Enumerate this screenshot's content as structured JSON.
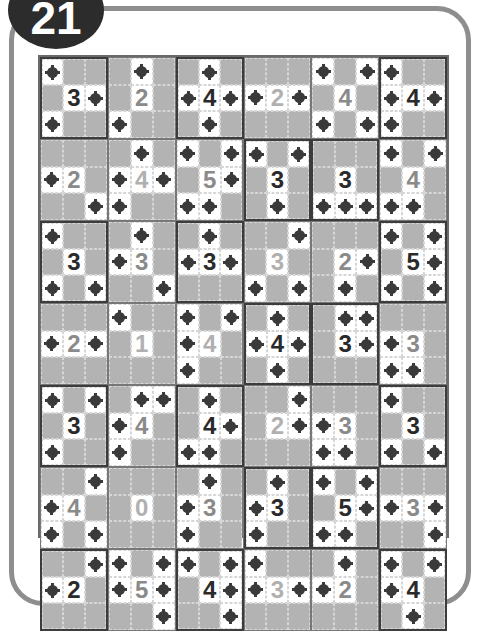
{
  "badge": {
    "label": "21"
  },
  "puzzle": {
    "columns": 6,
    "rows": 7,
    "colors": {
      "dark": "#2a2a2a",
      "gray": "#8a8a8a",
      "light": "#b0b0b0",
      "cell_shaded": "#b3b3b3",
      "cell_open": "#ffffff"
    },
    "blocks": [
      [
        {
          "n": "3",
          "tone": "dark",
          "mines": [
            [
              0,
              0
            ],
            [
              1,
              2
            ],
            [
              2,
              0
            ]
          ]
        },
        {
          "n": "2",
          "tone": "gray",
          "mines": [
            [
              0,
              1
            ],
            [
              2,
              0
            ]
          ]
        },
        {
          "n": "4",
          "tone": "dark",
          "mines": [
            [
              0,
              1
            ],
            [
              1,
              0
            ],
            [
              1,
              2
            ],
            [
              2,
              1
            ]
          ]
        },
        {
          "n": "2",
          "tone": "light",
          "mines": [
            [
              1,
              0
            ],
            [
              1,
              2
            ]
          ]
        },
        {
          "n": "4",
          "tone": "gray",
          "mines": [
            [
              0,
              0
            ],
            [
              0,
              2
            ],
            [
              2,
              0
            ],
            [
              2,
              2
            ]
          ]
        },
        {
          "n": "4",
          "tone": "dark",
          "mines": [
            [
              0,
              0
            ],
            [
              1,
              0
            ],
            [
              1,
              2
            ],
            [
              2,
              0
            ]
          ]
        }
      ],
      [
        {
          "n": "2",
          "tone": "gray",
          "mines": [
            [
              1,
              0
            ],
            [
              2,
              2
            ]
          ]
        },
        {
          "n": "4",
          "tone": "light",
          "mines": [
            [
              0,
              1
            ],
            [
              1,
              0
            ],
            [
              1,
              2
            ],
            [
              2,
              0
            ]
          ]
        },
        {
          "n": "5",
          "tone": "gray",
          "mines": [
            [
              0,
              0
            ],
            [
              0,
              2
            ],
            [
              1,
              2
            ],
            [
              2,
              0
            ],
            [
              2,
              1
            ]
          ]
        },
        {
          "n": "3",
          "tone": "dark",
          "mines": [
            [
              0,
              0
            ],
            [
              0,
              2
            ],
            [
              2,
              1
            ]
          ]
        },
        {
          "n": "3",
          "tone": "dark",
          "mines": [
            [
              2,
              0
            ],
            [
              2,
              1
            ],
            [
              2,
              2
            ]
          ]
        },
        {
          "n": "4",
          "tone": "gray",
          "mines": [
            [
              0,
              0
            ],
            [
              0,
              2
            ],
            [
              2,
              0
            ],
            [
              2,
              1
            ]
          ]
        }
      ],
      [
        {
          "n": "3",
          "tone": "dark",
          "mines": [
            [
              0,
              0
            ],
            [
              2,
              0
            ],
            [
              2,
              2
            ]
          ]
        },
        {
          "n": "3",
          "tone": "gray",
          "mines": [
            [
              0,
              1
            ],
            [
              1,
              0
            ],
            [
              2,
              2
            ]
          ]
        },
        {
          "n": "3",
          "tone": "dark",
          "mines": [
            [
              0,
              1
            ],
            [
              1,
              0
            ],
            [
              1,
              2
            ]
          ]
        },
        {
          "n": "3",
          "tone": "light",
          "mines": [
            [
              0,
              2
            ],
            [
              2,
              0
            ],
            [
              2,
              2
            ]
          ]
        },
        {
          "n": "2",
          "tone": "gray",
          "mines": [
            [
              1,
              2
            ],
            [
              2,
              1
            ]
          ]
        },
        {
          "n": "5",
          "tone": "dark",
          "mines": [
            [
              0,
              0
            ],
            [
              0,
              2
            ],
            [
              1,
              2
            ],
            [
              2,
              0
            ],
            [
              2,
              2
            ]
          ]
        }
      ],
      [
        {
          "n": "2",
          "tone": "gray",
          "mines": [
            [
              1,
              0
            ],
            [
              1,
              2
            ]
          ]
        },
        {
          "n": "1",
          "tone": "light",
          "mines": [
            [
              0,
              0
            ]
          ]
        },
        {
          "n": "4",
          "tone": "light",
          "mines": [
            [
              0,
              0
            ],
            [
              0,
              2
            ],
            [
              1,
              0
            ],
            [
              2,
              0
            ]
          ]
        },
        {
          "n": "4",
          "tone": "dark",
          "mines": [
            [
              0,
              1
            ],
            [
              1,
              0
            ],
            [
              1,
              2
            ],
            [
              2,
              1
            ]
          ]
        },
        {
          "n": "3",
          "tone": "dark",
          "mines": [
            [
              0,
              1
            ],
            [
              0,
              2
            ],
            [
              1,
              2
            ]
          ]
        },
        {
          "n": "3",
          "tone": "gray",
          "mines": [
            [
              1,
              0
            ],
            [
              2,
              0
            ],
            [
              2,
              1
            ]
          ]
        }
      ],
      [
        {
          "n": "3",
          "tone": "dark",
          "mines": [
            [
              0,
              0
            ],
            [
              0,
              2
            ],
            [
              2,
              0
            ]
          ]
        },
        {
          "n": "4",
          "tone": "gray",
          "mines": [
            [
              0,
              1
            ],
            [
              0,
              2
            ],
            [
              1,
              0
            ],
            [
              2,
              0
            ]
          ]
        },
        {
          "n": "4",
          "tone": "dark",
          "mines": [
            [
              0,
              1
            ],
            [
              1,
              2
            ],
            [
              2,
              0
            ],
            [
              2,
              1
            ]
          ]
        },
        {
          "n": "2",
          "tone": "light",
          "mines": [
            [
              0,
              2
            ],
            [
              1,
              2
            ]
          ]
        },
        {
          "n": "3",
          "tone": "gray",
          "mines": [
            [
              1,
              0
            ],
            [
              2,
              0
            ],
            [
              2,
              1
            ]
          ]
        },
        {
          "n": "3",
          "tone": "dark",
          "mines": [
            [
              0,
              0
            ],
            [
              2,
              0
            ],
            [
              2,
              2
            ]
          ]
        }
      ],
      [
        {
          "n": "4",
          "tone": "gray",
          "mines": [
            [
              0,
              2
            ],
            [
              1,
              0
            ],
            [
              2,
              0
            ],
            [
              2,
              2
            ]
          ]
        },
        {
          "n": "0",
          "tone": "light",
          "mines": []
        },
        {
          "n": "3",
          "tone": "gray",
          "mines": [
            [
              0,
              1
            ],
            [
              1,
              0
            ],
            [
              2,
              0
            ]
          ]
        },
        {
          "n": "3",
          "tone": "dark",
          "mines": [
            [
              0,
              1
            ],
            [
              1,
              0
            ],
            [
              2,
              0
            ]
          ]
        },
        {
          "n": "5",
          "tone": "dark",
          "mines": [
            [
              0,
              0
            ],
            [
              0,
              2
            ],
            [
              1,
              2
            ],
            [
              2,
              0
            ],
            [
              2,
              1
            ]
          ]
        },
        {
          "n": "3",
          "tone": "gray",
          "mines": [
            [
              1,
              0
            ],
            [
              1,
              2
            ],
            [
              2,
              2
            ]
          ]
        }
      ],
      [
        {
          "n": "2",
          "tone": "dark",
          "mines": [
            [
              0,
              2
            ],
            [
              1,
              0
            ]
          ]
        },
        {
          "n": "5",
          "tone": "gray",
          "mines": [
            [
              0,
              0
            ],
            [
              0,
              2
            ],
            [
              1,
              0
            ],
            [
              1,
              2
            ],
            [
              2,
              2
            ]
          ]
        },
        {
          "n": "4",
          "tone": "dark",
          "mines": [
            [
              0,
              0
            ],
            [
              0,
              2
            ],
            [
              1,
              2
            ],
            [
              2,
              2
            ]
          ]
        },
        {
          "n": "3",
          "tone": "light",
          "mines": [
            [
              0,
              0
            ],
            [
              1,
              0
            ],
            [
              1,
              2
            ]
          ]
        },
        {
          "n": "2",
          "tone": "gray",
          "mines": [
            [
              0,
              1
            ],
            [
              1,
              0
            ]
          ]
        },
        {
          "n": "4",
          "tone": "dark",
          "mines": [
            [
              0,
              0
            ],
            [
              0,
              2
            ],
            [
              1,
              0
            ],
            [
              2,
              1
            ]
          ]
        }
      ]
    ]
  }
}
